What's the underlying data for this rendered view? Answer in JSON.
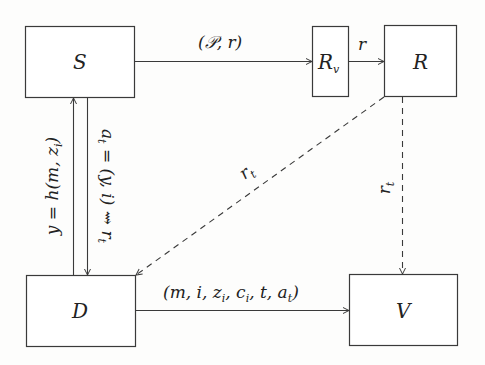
{
  "diagram": {
    "nodes": [
      {
        "id": "S",
        "label": "S"
      },
      {
        "id": "Rv",
        "label": "R",
        "subscript": "v"
      },
      {
        "id": "R",
        "label": "R"
      },
      {
        "id": "D",
        "label": "D"
      },
      {
        "id": "V",
        "label": "V"
      }
    ],
    "edges": [
      {
        "from": "S",
        "to": "Rv",
        "label": "(𝒫, r)",
        "style": "solid"
      },
      {
        "from": "Rv",
        "to": "R",
        "label": "r",
        "style": "solid"
      },
      {
        "from": "D",
        "to": "S",
        "label": "y = h(m, z",
        "label_sub": "i",
        "label_end": ")",
        "style": "solid"
      },
      {
        "from": "S",
        "to": "D",
        "label": "a",
        "label_sub": "t",
        "label_rest": " = (y, i) ⇝ r",
        "label_sub2": "t",
        "style": "solid"
      },
      {
        "from": "R",
        "to": "D",
        "label": "r",
        "label_sub": "t",
        "style": "dashed"
      },
      {
        "from": "R",
        "to": "V",
        "label": "r",
        "label_sub": "t",
        "style": "dashed"
      },
      {
        "from": "D",
        "to": "V",
        "label": "(m, i, z",
        "label_sub": "i",
        "label_rest": ", c",
        "label_sub2": "i",
        "label_rest2": ", t, a",
        "label_sub3": "t",
        "label_end": ")",
        "style": "solid"
      }
    ]
  },
  "colors": {
    "stroke": "#3a3a3a",
    "text": "#222222",
    "background": "#fdfdfc"
  }
}
